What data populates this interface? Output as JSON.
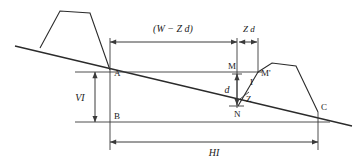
{
  "figure": {
    "type": "engineering-cross-section",
    "background_color": "#ffffff",
    "line_color": "#2b2b2b",
    "text_color": "#1a1a1a"
  },
  "dimensions": {
    "top_left_span": "(W − Z d)",
    "top_right_span": "Z d",
    "vertical_left": "VI",
    "vertical_small": "d",
    "bottom_span": "HI"
  },
  "points": {
    "a": "A",
    "b": "B",
    "c": "C",
    "m": "M",
    "m_prime": "M'",
    "i": "I",
    "n": "N",
    "z": "Z"
  },
  "geometry": {
    "ground_line": {
      "x1": 15,
      "y1": 46,
      "x2": 352,
      "y2": 126
    },
    "left_embankment": "40,48 60,11 90,13 110,70",
    "right_embankment": "258,72 272,63 296,66 318,112",
    "level_line_a": {
      "x": 75,
      "y": 72,
      "x2": 262
    },
    "level_line_b": {
      "x": 75,
      "y": 122,
      "x2": 330
    },
    "vertical_at_a": {
      "x": 110,
      "y1": 40,
      "y2": 150
    },
    "vertical_at_m": {
      "x": 237,
      "y1": 40,
      "y2": 108
    },
    "vertical_at_mprime": {
      "x": 258,
      "y1": 40,
      "y2": 72
    },
    "vertical_at_c": {
      "x": 318,
      "y1": 112,
      "y2": 150
    },
    "top_dim_y": 42,
    "bottom_dim_y": 142,
    "d_dim_x": 237,
    "vi_dim_x": 95
  }
}
